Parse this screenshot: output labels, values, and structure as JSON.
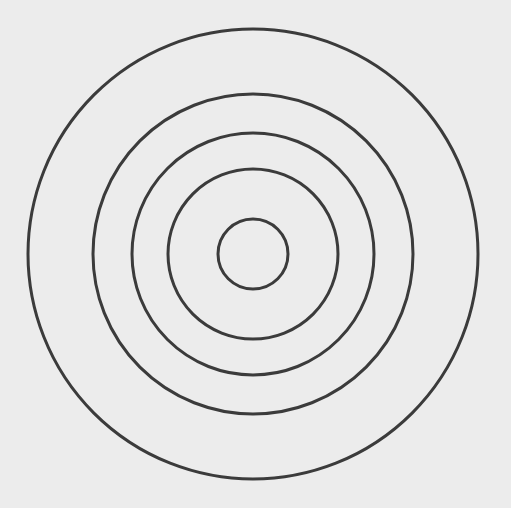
{
  "canvas": {
    "width": 511,
    "height": 508,
    "background_color": "#ececec",
    "title": "Concentric Circles"
  },
  "figure": {
    "name": "concentric-circles",
    "center_x": 253,
    "center_y": 254,
    "stroke_color": "#3b3b3b",
    "fill": "none",
    "ring_count": 5
  },
  "chart_data": {
    "type": "scatter",
    "xlabel": "",
    "ylabel": "",
    "xlim": [
      0,
      511
    ],
    "ylim": [
      0,
      508
    ],
    "grid": false,
    "legend": "none",
    "center": [
      253,
      254
    ],
    "radii": [
      225,
      160,
      121,
      85,
      35
    ],
    "stroke_widths": [
      3,
      3,
      3,
      3,
      3
    ],
    "stroke_color": "#3b3b3b",
    "background_color": "#ececec",
    "rings": [
      {
        "index": 1,
        "label": "outer-ring",
        "radius": 225,
        "diameter": 450,
        "stroke_width": 3,
        "stroke_color": "#3b3b3b",
        "fill": "none",
        "left_edge_x": 28,
        "right_edge_x": 478,
        "top_edge_y": 29,
        "bottom_edge_y": 479
      },
      {
        "index": 2,
        "label": "second-ring",
        "radius": 160,
        "diameter": 320,
        "stroke_width": 3,
        "stroke_color": "#3b3b3b",
        "fill": "none",
        "left_edge_x": 93,
        "right_edge_x": 413,
        "top_edge_y": 94,
        "bottom_edge_y": 414
      },
      {
        "index": 3,
        "label": "third-ring",
        "radius": 121,
        "diameter": 242,
        "stroke_width": 3,
        "stroke_color": "#3b3b3b",
        "fill": "none",
        "left_edge_x": 132,
        "right_edge_x": 374,
        "top_edge_y": 133,
        "bottom_edge_y": 375
      },
      {
        "index": 4,
        "label": "fourth-ring",
        "radius": 85,
        "diameter": 170,
        "stroke_width": 3,
        "stroke_color": "#3b3b3b",
        "fill": "none",
        "left_edge_x": 168,
        "right_edge_x": 338,
        "top_edge_y": 169,
        "bottom_edge_y": 339
      },
      {
        "index": 5,
        "label": "inner-ring",
        "radius": 35,
        "diameter": 70,
        "stroke_width": 3,
        "stroke_color": "#3b3b3b",
        "fill": "none",
        "left_edge_x": 218,
        "right_edge_x": 288,
        "top_edge_y": 219,
        "bottom_edge_y": 289
      }
    ]
  }
}
